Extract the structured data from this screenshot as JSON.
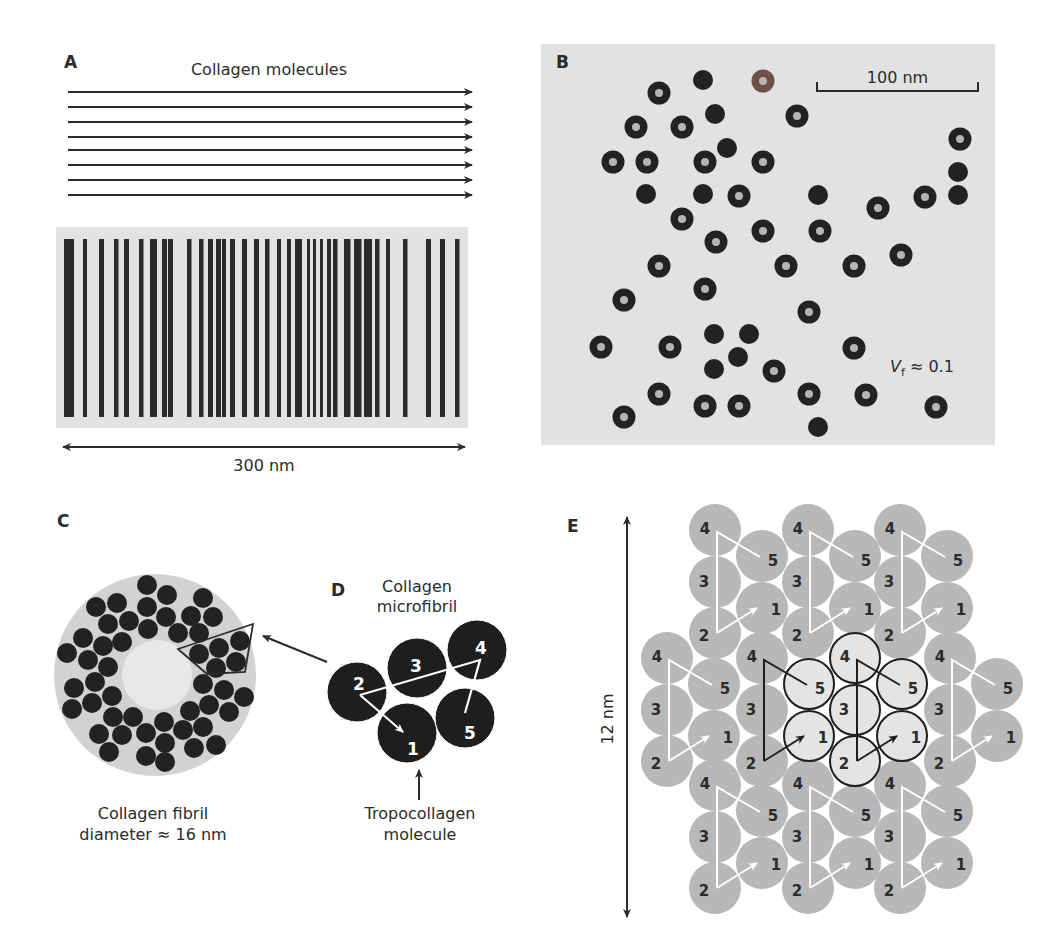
{
  "colors": {
    "ink": "#2b2b2b",
    "panel_bg": "#e2e2e2",
    "fibril_bg": "#d2d2d2",
    "fibril_core": "#e8e8e8",
    "e_circle": "#b8b8b8",
    "e_highlight": "#e4e4e4",
    "ring_hole": "#b5b5b5",
    "ring_brown": "#6e5048"
  },
  "panel_a": {
    "label": "A",
    "title": "Collagen molecules",
    "arrow_rows_y": [
      92,
      107,
      122,
      137,
      150,
      165,
      180,
      195
    ],
    "arrow_x": [
      68,
      472
    ],
    "band_box": {
      "x": 56,
      "y": 227,
      "w": 412,
      "h": 201
    },
    "band_y": [
      239,
      417
    ],
    "bands": [
      [
        64,
        10
      ],
      [
        83,
        4
      ],
      [
        99,
        5
      ],
      [
        114,
        4.5
      ],
      [
        124,
        5
      ],
      [
        139,
        4.5
      ],
      [
        150,
        7
      ],
      [
        162,
        5
      ],
      [
        168,
        5
      ],
      [
        187,
        4.5
      ],
      [
        199,
        4.5
      ],
      [
        208,
        5
      ],
      [
        216,
        5
      ],
      [
        222,
        4
      ],
      [
        230,
        5
      ],
      [
        242,
        5
      ],
      [
        254,
        5
      ],
      [
        265,
        4.5
      ],
      [
        277,
        4
      ],
      [
        287,
        4
      ],
      [
        295,
        7
      ],
      [
        307,
        3
      ],
      [
        313,
        3
      ],
      [
        320,
        3
      ],
      [
        327,
        4
      ],
      [
        333,
        4.5
      ],
      [
        344,
        6.5
      ],
      [
        354,
        7.5
      ],
      [
        364,
        8
      ],
      [
        375,
        4.5
      ],
      [
        386,
        4
      ],
      [
        403,
        4.5
      ],
      [
        426,
        5
      ],
      [
        440,
        5
      ],
      [
        455,
        4.5
      ]
    ],
    "scale": {
      "x1": 63,
      "x2": 465,
      "y": 447,
      "label": "300 nm"
    }
  },
  "panel_b": {
    "label": "B",
    "box": {
      "x": 541,
      "y": 44,
      "w": 454,
      "h": 401
    },
    "scale_bar": {
      "x1": 817,
      "x2": 978,
      "y": 91,
      "label": "100 nm"
    },
    "volume_fraction": {
      "symbol": "V",
      "subscript": "f",
      "text": " ≈ 0.1"
    },
    "fibrils": [
      {
        "x": 703,
        "y": 80,
        "t": "filled"
      },
      {
        "x": 763,
        "y": 81,
        "t": "brown"
      },
      {
        "x": 659,
        "y": 93,
        "t": "ring"
      },
      {
        "x": 715,
        "y": 114,
        "t": "filled"
      },
      {
        "x": 797,
        "y": 116,
        "t": "ring"
      },
      {
        "x": 636,
        "y": 127,
        "t": "ring"
      },
      {
        "x": 682,
        "y": 127,
        "t": "ring"
      },
      {
        "x": 960,
        "y": 139,
        "t": "ring"
      },
      {
        "x": 727,
        "y": 148,
        "t": "filled"
      },
      {
        "x": 613,
        "y": 162,
        "t": "ring"
      },
      {
        "x": 647,
        "y": 162,
        "t": "ring"
      },
      {
        "x": 705,
        "y": 162,
        "t": "ring"
      },
      {
        "x": 763,
        "y": 162,
        "t": "ring"
      },
      {
        "x": 958,
        "y": 172,
        "t": "filled"
      },
      {
        "x": 646,
        "y": 194,
        "t": "filled"
      },
      {
        "x": 703,
        "y": 194,
        "t": "filled"
      },
      {
        "x": 739,
        "y": 196,
        "t": "ring"
      },
      {
        "x": 818,
        "y": 195,
        "t": "filled"
      },
      {
        "x": 925,
        "y": 197,
        "t": "ring"
      },
      {
        "x": 958,
        "y": 195,
        "t": "filled"
      },
      {
        "x": 878,
        "y": 208,
        "t": "ring"
      },
      {
        "x": 682,
        "y": 219,
        "t": "ring"
      },
      {
        "x": 763,
        "y": 231,
        "t": "ring"
      },
      {
        "x": 820,
        "y": 231,
        "t": "ring"
      },
      {
        "x": 716,
        "y": 242,
        "t": "ring"
      },
      {
        "x": 901,
        "y": 255,
        "t": "ring"
      },
      {
        "x": 659,
        "y": 266,
        "t": "ring"
      },
      {
        "x": 786,
        "y": 266,
        "t": "ring"
      },
      {
        "x": 854,
        "y": 266,
        "t": "ring"
      },
      {
        "x": 705,
        "y": 289,
        "t": "ring"
      },
      {
        "x": 624,
        "y": 300,
        "t": "ring"
      },
      {
        "x": 809,
        "y": 312,
        "t": "ring"
      },
      {
        "x": 714,
        "y": 334,
        "t": "filled"
      },
      {
        "x": 749,
        "y": 334,
        "t": "filled"
      },
      {
        "x": 601,
        "y": 347,
        "t": "ring"
      },
      {
        "x": 670,
        "y": 347,
        "t": "ring"
      },
      {
        "x": 854,
        "y": 348,
        "t": "ring"
      },
      {
        "x": 738,
        "y": 357,
        "t": "filled"
      },
      {
        "x": 714,
        "y": 369,
        "t": "filled"
      },
      {
        "x": 774,
        "y": 371,
        "t": "ring"
      },
      {
        "x": 659,
        "y": 394,
        "t": "ring"
      },
      {
        "x": 809,
        "y": 394,
        "t": "ring"
      },
      {
        "x": 866,
        "y": 395,
        "t": "ring"
      },
      {
        "x": 705,
        "y": 406,
        "t": "ring"
      },
      {
        "x": 739,
        "y": 406,
        "t": "ring"
      },
      {
        "x": 936,
        "y": 407,
        "t": "ring"
      },
      {
        "x": 624,
        "y": 417,
        "t": "ring"
      },
      {
        "x": 818,
        "y": 427,
        "t": "filled"
      }
    ]
  },
  "panel_c": {
    "label": "C",
    "fibril": {
      "cx": 155,
      "cy": 675,
      "r": 101,
      "core_r": 35
    },
    "molecule_r": 10,
    "molecules": [
      [
        147,
        585
      ],
      [
        167,
        595
      ],
      [
        203,
        598
      ],
      [
        96,
        607
      ],
      [
        117,
        603
      ],
      [
        147,
        607
      ],
      [
        166,
        617
      ],
      [
        191,
        616
      ],
      [
        213,
        617
      ],
      [
        108,
        624
      ],
      [
        129,
        621
      ],
      [
        148,
        629
      ],
      [
        178,
        633
      ],
      [
        199,
        633
      ],
      [
        83,
        638
      ],
      [
        240,
        641
      ],
      [
        103,
        646
      ],
      [
        122,
        642
      ],
      [
        219,
        648
      ],
      [
        199,
        654
      ],
      [
        67,
        653
      ],
      [
        88,
        660
      ],
      [
        236,
        662
      ],
      [
        108,
        667
      ],
      [
        216,
        668
      ],
      [
        95,
        682
      ],
      [
        203,
        684
      ],
      [
        74,
        688
      ],
      [
        224,
        690
      ],
      [
        244,
        697
      ],
      [
        112,
        696
      ],
      [
        92,
        703
      ],
      [
        209,
        705
      ],
      [
        72,
        709
      ],
      [
        190,
        711
      ],
      [
        229,
        712
      ],
      [
        113,
        717
      ],
      [
        133,
        717
      ],
      [
        164,
        722
      ],
      [
        183,
        730
      ],
      [
        203,
        727
      ],
      [
        99,
        734
      ],
      [
        122,
        735
      ],
      [
        146,
        733
      ],
      [
        165,
        743
      ],
      [
        194,
        748
      ],
      [
        216,
        745
      ],
      [
        109,
        752
      ],
      [
        146,
        756
      ],
      [
        165,
        762
      ]
    ],
    "outline": [
      [
        178,
        649
      ],
      [
        253,
        624
      ],
      [
        245,
        672
      ],
      [
        207,
        674
      ]
    ],
    "pointer_arrow": {
      "x1": 327,
      "y1": 662,
      "x2": 263,
      "y2": 636
    },
    "caption": [
      "Collagen fibril",
      "diameter ≈ 16 nm"
    ]
  },
  "panel_d": {
    "label": "D",
    "title": [
      "Collagen",
      "microfibril"
    ],
    "circles": [
      {
        "n": "2",
        "cx": 357,
        "cy": 692,
        "lx": 359,
        "ly": 690
      },
      {
        "n": "3",
        "cx": 417,
        "cy": 668,
        "lx": 416,
        "ly": 672
      },
      {
        "n": "4",
        "cx": 477,
        "cy": 650,
        "lx": 481,
        "ly": 654
      },
      {
        "n": "1",
        "cx": 407,
        "cy": 733,
        "lx": 413,
        "ly": 755
      },
      {
        "n": "5",
        "cx": 465,
        "cy": 718,
        "lx": 470,
        "ly": 739
      }
    ],
    "radius": 30,
    "path": [
      [
        360,
        695
      ],
      [
        480,
        660
      ],
      [
        465,
        713
      ]
    ],
    "arrow": {
      "x1": 360,
      "y1": 695,
      "x2": 403,
      "y2": 732
    },
    "caption": [
      "Tropocollagen",
      "molecule"
    ],
    "up_arrow": {
      "x": 419,
      "y1": 800,
      "y2": 770
    }
  },
  "panel_e": {
    "label": "E",
    "scale": {
      "x": 627,
      "y1": 517,
      "y2": 917,
      "label": "12 nm"
    },
    "circle_r": 26,
    "col_dx": 47,
    "units": [
      {
        "x": 715,
        "y": 530,
        "style": "gray"
      },
      {
        "x": 808,
        "y": 530,
        "style": "gray"
      },
      {
        "x": 900,
        "y": 530,
        "style": "gray"
      },
      {
        "x": 667,
        "y": 658,
        "style": "gray"
      },
      {
        "x": 762,
        "y": 658,
        "style": "left-hl"
      },
      {
        "x": 855,
        "y": 658,
        "style": "center-hl"
      },
      {
        "x": 950,
        "y": 658,
        "style": "gray"
      },
      {
        "x": 715,
        "y": 785,
        "style": "gray"
      },
      {
        "x": 808,
        "y": 785,
        "style": "gray"
      },
      {
        "x": 900,
        "y": 785,
        "style": "gray"
      }
    ],
    "members": [
      {
        "n": "4",
        "dx": 0,
        "dy": 0,
        "lx": -10,
        "ly": 4
      },
      {
        "n": "5",
        "dx": 47,
        "dy": 26,
        "lx": 11,
        "ly": 10
      },
      {
        "n": "3",
        "dx": 0,
        "dy": 52,
        "lx": -11,
        "ly": 5
      },
      {
        "n": "1",
        "dx": 47,
        "dy": 78,
        "lx": 14,
        "ly": 7
      },
      {
        "n": "2",
        "dx": 0,
        "dy": 103,
        "lx": -11,
        "ly": 8
      }
    ]
  }
}
